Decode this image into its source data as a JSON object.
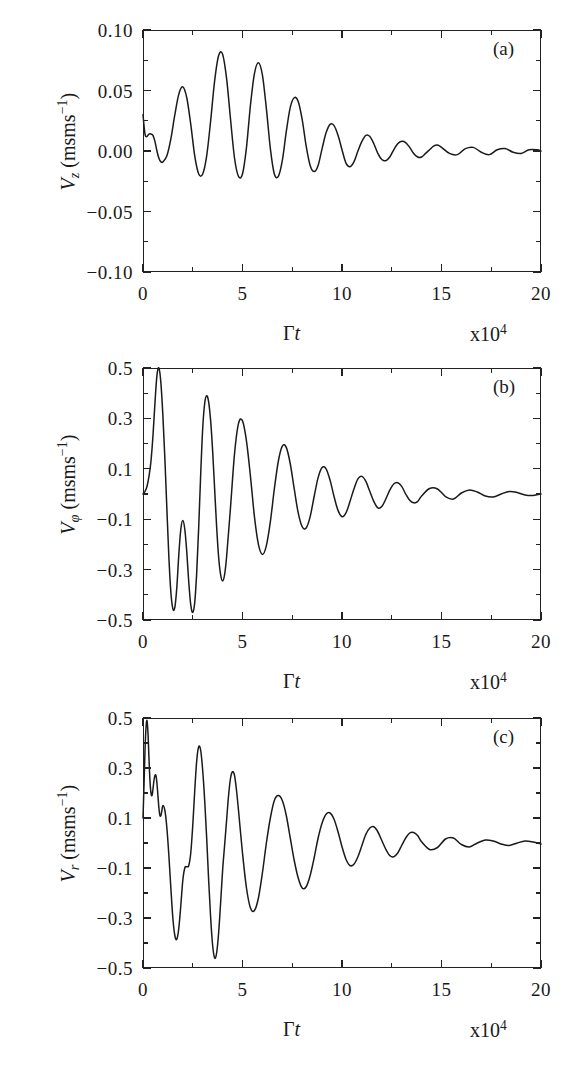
{
  "figure": {
    "panel_count": 3,
    "axis": {
      "x_title_gamma": "Γ",
      "x_title_t": "t",
      "x_exponent_prefix": "x10",
      "x_exponent_power": "4",
      "x_ticks": [
        "0",
        "5",
        "10",
        "15",
        "20"
      ],
      "x_min": 0,
      "x_max": 20,
      "line_color": "#222222",
      "curve_color": "#1a1a1a"
    }
  },
  "panels": [
    {
      "tag": "(a)",
      "y_symbol": "V",
      "y_subscript": "z",
      "y_unit_open": " (ms",
      "y_unit_exp": "−1",
      "y_unit_close": ")",
      "y_ticks": [
        "0.10",
        "0.05",
        "0.00",
        "−0.05",
        "−0.10"
      ],
      "y_min": -0.1,
      "y_max": 0.1
    },
    {
      "tag": "(b)",
      "y_symbol": "V",
      "y_subscript": "φ",
      "y_unit_open": " (ms",
      "y_unit_exp": "−1",
      "y_unit_close": ")",
      "y_ticks": [
        "0.5",
        "0.3",
        "0.1",
        "−0.1",
        "−0.3",
        "−0.5"
      ],
      "y_min": -0.5,
      "y_max": 0.5
    },
    {
      "tag": "(c)",
      "y_symbol": "V",
      "y_subscript": "r",
      "y_unit_open": " (ms",
      "y_unit_exp": "−1",
      "y_unit_close": ")",
      "y_ticks": [
        "0.5",
        "0.3",
        "0.1",
        "−0.1",
        "−0.3",
        "−0.5"
      ],
      "y_min": -0.5,
      "y_max": 0.5
    }
  ],
  "chart_data": [
    {
      "type": "line",
      "title": "(a)",
      "xlabel": "Γt  (x10^4)",
      "ylabel": "V_z (ms^-1)",
      "xlim": [
        0,
        20
      ],
      "ylim": [
        -0.1,
        0.1
      ],
      "xticks": [
        0,
        5,
        10,
        15,
        20
      ],
      "yticks": [
        -0.1,
        -0.05,
        0.0,
        0.05,
        0.1
      ],
      "grid": false,
      "legend": "none",
      "series": [
        {
          "name": "V_z",
          "x": [
            0.0,
            0.1,
            0.2,
            0.3,
            0.4,
            0.5,
            0.6,
            0.7,
            0.8,
            0.9,
            1.0,
            1.2,
            1.4,
            1.6,
            1.8,
            2.0,
            2.2,
            2.4,
            2.6,
            2.8,
            3.0,
            3.2,
            3.4,
            3.6,
            3.8,
            4.0,
            4.2,
            4.4,
            4.6,
            4.8,
            5.0,
            5.2,
            5.4,
            5.6,
            5.8,
            6.0,
            6.2,
            6.4,
            6.6,
            6.8,
            7.0,
            7.2,
            7.4,
            7.6,
            7.8,
            8.0,
            8.2,
            8.4,
            8.6,
            8.8,
            9.0,
            9.2,
            9.4,
            9.6,
            9.8,
            10.0,
            10.2,
            10.4,
            10.6,
            10.8,
            11.0,
            11.2,
            11.4,
            11.6,
            11.8,
            12.0,
            12.2,
            12.4,
            12.6,
            12.8,
            13.0,
            13.2,
            13.4,
            13.6,
            13.8,
            14.0,
            14.2,
            14.4,
            14.6,
            14.8,
            15.0,
            15.4,
            15.8,
            16.2,
            16.6,
            17.0,
            17.4,
            17.8,
            18.2,
            18.6,
            19.0,
            19.4,
            19.8,
            20.0
          ],
          "y": [
            0.03,
            0.014,
            0.012,
            0.014,
            0.014,
            0.013,
            0.008,
            0.0,
            -0.006,
            -0.009,
            -0.009,
            -0.004,
            0.01,
            0.03,
            0.047,
            0.053,
            0.044,
            0.022,
            -0.004,
            -0.019,
            -0.019,
            -0.004,
            0.025,
            0.058,
            0.079,
            0.08,
            0.06,
            0.026,
            -0.006,
            -0.021,
            -0.019,
            0.003,
            0.038,
            0.064,
            0.073,
            0.063,
            0.035,
            0.002,
            -0.019,
            -0.021,
            -0.008,
            0.016,
            0.036,
            0.044,
            0.041,
            0.026,
            0.004,
            -0.012,
            -0.017,
            -0.012,
            0.002,
            0.015,
            0.022,
            0.021,
            0.013,
            0.001,
            -0.01,
            -0.013,
            -0.009,
            0.0,
            0.008,
            0.013,
            0.012,
            0.006,
            -0.002,
            -0.007,
            -0.008,
            -0.005,
            0.001,
            0.006,
            0.008,
            0.007,
            0.003,
            -0.002,
            -0.005,
            -0.005,
            -0.002,
            0.001,
            0.004,
            0.005,
            0.003,
            -0.002,
            -0.003,
            0.002,
            0.003,
            -0.001,
            -0.003,
            0.001,
            0.002,
            -0.001,
            -0.002,
            0.001,
            0.001,
            0.0,
            0.0
          ]
        }
      ]
    },
    {
      "type": "line",
      "title": "(b)",
      "xlabel": "Γt  (x10^4)",
      "ylabel": "V_φ (ms^-1)",
      "xlim": [
        0,
        20
      ],
      "ylim": [
        -0.5,
        0.5
      ],
      "xticks": [
        0,
        5,
        10,
        15,
        20
      ],
      "yticks": [
        -0.5,
        -0.3,
        -0.1,
        0.1,
        0.3,
        0.5
      ],
      "grid": false,
      "legend": "none",
      "series": [
        {
          "name": "V_phi",
          "x": [
            0.0,
            0.1,
            0.2,
            0.3,
            0.4,
            0.5,
            0.6,
            0.7,
            0.8,
            0.9,
            1.0,
            1.1,
            1.2,
            1.3,
            1.4,
            1.5,
            1.6,
            1.7,
            1.8,
            1.9,
            2.0,
            2.1,
            2.2,
            2.3,
            2.4,
            2.5,
            2.6,
            2.7,
            2.8,
            2.9,
            3.0,
            3.1,
            3.2,
            3.3,
            3.4,
            3.5,
            3.6,
            3.7,
            3.8,
            3.9,
            4.0,
            4.1,
            4.2,
            4.4,
            4.6,
            4.8,
            5.0,
            5.2,
            5.4,
            5.6,
            5.8,
            6.0,
            6.2,
            6.4,
            6.6,
            6.8,
            7.0,
            7.2,
            7.4,
            7.6,
            7.8,
            8.0,
            8.2,
            8.4,
            8.6,
            8.8,
            9.0,
            9.2,
            9.4,
            9.6,
            9.8,
            10.0,
            10.2,
            10.4,
            10.6,
            10.8,
            11.0,
            11.2,
            11.4,
            11.6,
            11.8,
            12.0,
            12.2,
            12.4,
            12.6,
            12.8,
            13.0,
            13.2,
            13.4,
            13.6,
            13.8,
            14.0,
            14.4,
            14.8,
            15.2,
            15.6,
            16.0,
            16.4,
            16.8,
            17.2,
            17.6,
            18.0,
            18.4,
            18.8,
            19.2,
            19.6,
            20.0
          ],
          "y": [
            0.0,
            0.01,
            0.03,
            0.07,
            0.13,
            0.23,
            0.36,
            0.47,
            0.5,
            0.44,
            0.31,
            0.14,
            -0.06,
            -0.25,
            -0.39,
            -0.455,
            -0.45,
            -0.37,
            -0.24,
            -0.14,
            -0.105,
            -0.14,
            -0.23,
            -0.35,
            -0.44,
            -0.47,
            -0.43,
            -0.31,
            -0.13,
            0.08,
            0.26,
            0.36,
            0.39,
            0.365,
            0.29,
            0.17,
            0.02,
            -0.13,
            -0.25,
            -0.32,
            -0.345,
            -0.32,
            -0.25,
            -0.05,
            0.16,
            0.28,
            0.29,
            0.21,
            0.07,
            -0.09,
            -0.2,
            -0.24,
            -0.205,
            -0.11,
            0.02,
            0.13,
            0.19,
            0.185,
            0.12,
            0.02,
            -0.075,
            -0.13,
            -0.135,
            -0.09,
            -0.01,
            0.065,
            0.105,
            0.1,
            0.055,
            -0.01,
            -0.065,
            -0.09,
            -0.075,
            -0.03,
            0.02,
            0.06,
            0.07,
            0.05,
            0.01,
            -0.03,
            -0.055,
            -0.05,
            -0.02,
            0.015,
            0.04,
            0.045,
            0.03,
            0.0,
            -0.025,
            -0.035,
            -0.03,
            -0.008,
            0.022,
            0.02,
            -0.01,
            -0.02,
            0.004,
            0.016,
            0.008,
            -0.008,
            -0.012,
            0.0,
            0.01,
            0.006,
            -0.004,
            -0.006,
            0.0,
            0.002
          ]
        }
      ]
    },
    {
      "type": "line",
      "title": "(c)",
      "xlabel": "Γt  (x10^4)",
      "ylabel": "V_r (ms^-1)",
      "xlim": [
        0,
        20
      ],
      "ylim": [
        -0.5,
        0.5
      ],
      "xticks": [
        0,
        5,
        10,
        15,
        20
      ],
      "yticks": [
        -0.5,
        -0.3,
        -0.1,
        0.1,
        0.3,
        0.5
      ],
      "grid": false,
      "legend": "none",
      "series": [
        {
          "name": "V_r",
          "x": [
            0.0,
            0.05,
            0.1,
            0.15,
            0.2,
            0.25,
            0.3,
            0.35,
            0.4,
            0.45,
            0.5,
            0.55,
            0.6,
            0.65,
            0.7,
            0.75,
            0.8,
            0.85,
            0.9,
            0.95,
            1.0,
            1.1,
            1.2,
            1.3,
            1.4,
            1.5,
            1.6,
            1.7,
            1.8,
            1.9,
            2.0,
            2.1,
            2.2,
            2.3,
            2.4,
            2.5,
            2.6,
            2.7,
            2.8,
            2.9,
            3.0,
            3.1,
            3.2,
            3.3,
            3.4,
            3.5,
            3.6,
            3.7,
            3.8,
            3.9,
            4.0,
            4.1,
            4.2,
            4.3,
            4.4,
            4.5,
            4.6,
            4.7,
            4.8,
            5.0,
            5.2,
            5.4,
            5.6,
            5.8,
            6.0,
            6.2,
            6.4,
            6.6,
            6.8,
            7.0,
            7.2,
            7.4,
            7.6,
            7.8,
            8.0,
            8.2,
            8.4,
            8.6,
            8.8,
            9.0,
            9.2,
            9.4,
            9.6,
            9.8,
            10.0,
            10.2,
            10.4,
            10.6,
            10.8,
            11.0,
            11.2,
            11.4,
            11.6,
            11.8,
            12.0,
            12.2,
            12.4,
            12.6,
            12.8,
            13.0,
            13.2,
            13.4,
            13.6,
            13.8,
            14.0,
            14.4,
            14.8,
            15.2,
            15.6,
            16.0,
            16.4,
            16.8,
            17.2,
            17.6,
            18.0,
            18.4,
            18.8,
            19.2,
            19.6,
            20.0
          ],
          "y": [
            0.1,
            0.23,
            0.37,
            0.46,
            0.49,
            0.44,
            0.34,
            0.25,
            0.2,
            0.19,
            0.215,
            0.25,
            0.27,
            0.27,
            0.24,
            0.19,
            0.14,
            0.11,
            0.11,
            0.13,
            0.15,
            0.13,
            0.06,
            -0.05,
            -0.18,
            -0.3,
            -0.37,
            -0.385,
            -0.34,
            -0.25,
            -0.15,
            -0.1,
            -0.095,
            -0.09,
            -0.04,
            0.07,
            0.21,
            0.33,
            0.385,
            0.37,
            0.29,
            0.17,
            0.02,
            -0.15,
            -0.3,
            -0.41,
            -0.46,
            -0.44,
            -0.36,
            -0.24,
            -0.11,
            -0.01,
            0.09,
            0.19,
            0.26,
            0.285,
            0.27,
            0.21,
            0.13,
            -0.04,
            -0.18,
            -0.26,
            -0.27,
            -0.22,
            -0.12,
            0.0,
            0.1,
            0.17,
            0.19,
            0.17,
            0.11,
            0.02,
            -0.07,
            -0.14,
            -0.18,
            -0.175,
            -0.13,
            -0.06,
            0.02,
            0.08,
            0.115,
            0.12,
            0.095,
            0.045,
            -0.015,
            -0.065,
            -0.09,
            -0.085,
            -0.055,
            -0.01,
            0.035,
            0.06,
            0.065,
            0.045,
            0.01,
            -0.025,
            -0.05,
            -0.055,
            -0.04,
            -0.01,
            0.02,
            0.04,
            0.042,
            0.03,
            0.005,
            -0.026,
            -0.018,
            0.016,
            0.02,
            -0.006,
            -0.016,
            0.0,
            0.012,
            0.008,
            -0.004,
            -0.01,
            0.0,
            0.008,
            0.004,
            -0.004,
            0.0
          ]
        }
      ]
    }
  ]
}
